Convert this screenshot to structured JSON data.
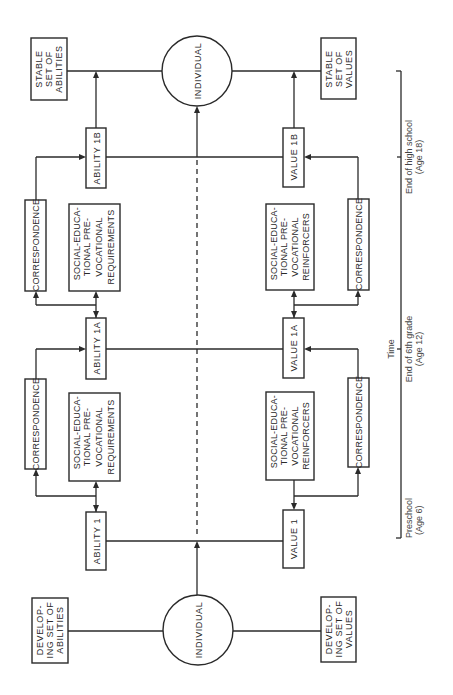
{
  "diagram": {
    "orientation": "rotated-90-ccw",
    "accent_color": "#2a2a2a",
    "individual_top": {
      "label": "INDIVIDUAL"
    },
    "individual_bottom": {
      "label": "INDIVIDUAL"
    },
    "stable_abilities": {
      "lines": [
        "STABLE",
        "SET OF",
        "ABILITIES"
      ]
    },
    "stable_values": {
      "lines": [
        "STABLE",
        "SET OF",
        "VALUES"
      ]
    },
    "developing_abilities": {
      "lines": [
        "DEVELOP-",
        "ING SET OF",
        "ABILITIES"
      ]
    },
    "developing_values": {
      "lines": [
        "DEVELOP-",
        "ING SET OF",
        "VALUES"
      ]
    },
    "ability_1": {
      "label": "ABILITY 1"
    },
    "ability_1a": {
      "label": "ABILITY 1A"
    },
    "ability_1b": {
      "label": "ABILITY 1B"
    },
    "value_1": {
      "label": "VALUE 1"
    },
    "value_1a": {
      "label": "VALUE 1A"
    },
    "value_1b": {
      "label": "VALUE 1B"
    },
    "correspondence": {
      "label": "CORRESPONDENCE"
    },
    "requirements_upper": {
      "lines": [
        "SOCIAL-EDUCA-",
        "TIONAL PRE-",
        "VOCATIONAL",
        "REQUIREMENTS"
      ]
    },
    "requirements_lower": {
      "lines": [
        "SOCIAL-EDUCA-",
        "TIONAL PRE-",
        "VOCATIONAL",
        "REQUIREMENTS"
      ]
    },
    "reinforcers_upper": {
      "lines": [
        "SOCIAL-EDUCA-",
        "TIONAL PRE-",
        "VOCATIONAL",
        "REINFORCERS"
      ]
    },
    "reinforcers_lower": {
      "lines": [
        "SOCIAL-EDUCA-",
        "TIONAL PRE-",
        "VOCATIONAL",
        "REINFORCERS"
      ]
    }
  },
  "timeline": {
    "axis_label": "Time",
    "ticks": [
      {
        "line1": "End of high school",
        "line2": "(Age 18)"
      },
      {
        "line1": "End of 6th grade",
        "line2": "(Age 12)"
      },
      {
        "line1": "Preschool",
        "line2": "(Age 6)"
      }
    ]
  }
}
